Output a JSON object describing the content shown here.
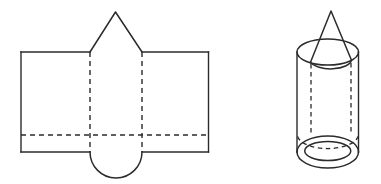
{
  "figure": {
    "title": "Net and solid of a cone-topped cylinder",
    "background_color": "#ffffff",
    "stroke_color": "#2b2b2b",
    "line_styles": {
      "solid_label": "solid edge (cut line)",
      "dashed_label": "dashed edge (fold or hidden line)"
    },
    "panels": [
      {
        "id": "net",
        "label": "Unfolded net",
        "description": "Rectangle with a triangular flap on top and a semicircular flap on the bottom, with vertical fold lines and one horizontal fold line.",
        "parts": [
          {
            "name": "outer-rectangle",
            "label": "Lateral surface rectangle",
            "style": "solid"
          },
          {
            "name": "triangle-flap",
            "label": "Triangular cone flap",
            "style": "solid"
          },
          {
            "name": "semicircle-flap",
            "label": "Semicircular base flap",
            "style": "solid"
          },
          {
            "name": "left-fold-line",
            "label": "Left vertical fold line",
            "style": "dashed"
          },
          {
            "name": "right-fold-line",
            "label": "Right vertical fold line",
            "style": "dashed"
          },
          {
            "name": "horizontal-fold-line",
            "label": "Horizontal fold line",
            "style": "dashed"
          }
        ]
      },
      {
        "id": "solid",
        "label": "Assembled solid",
        "description": "A cylinder capped by a cone, drawn in perspective with hidden edges dashed.",
        "parts": [
          {
            "name": "cone",
            "label": "Cone on top",
            "style": "solid"
          },
          {
            "name": "cylinder-body",
            "label": "Cylinder body",
            "style": "solid"
          },
          {
            "name": "top-ellipse",
            "label": "Top rim ellipse",
            "style": "solid"
          },
          {
            "name": "bottom-ellipse-outer",
            "label": "Bottom outer rim ellipse",
            "style": "solid"
          },
          {
            "name": "bottom-ellipse-inner",
            "label": "Bottom inner rim ellipse",
            "style": "solid"
          },
          {
            "name": "hidden-left-edge",
            "label": "Hidden left cone edge",
            "style": "dashed"
          },
          {
            "name": "hidden-right-edge",
            "label": "Hidden right cone edge",
            "style": "dashed"
          },
          {
            "name": "hidden-bottom-arc",
            "label": "Hidden bottom arc",
            "style": "dashed"
          }
        ]
      }
    ],
    "geometry": {
      "net": {
        "rect_left": 21,
        "rect_right": 208.5,
        "rect_top": 52,
        "rect_bottom": 152,
        "fold_left_x": 90,
        "fold_right_x": 142,
        "fold_horizontal_y": 135,
        "triangle_apex_x": 115.5,
        "triangle_apex_y": 12,
        "semicircle_bottom_y": 178.5
      },
      "solid": {
        "cyl_left_x": 297,
        "cyl_right_x": 358.5,
        "cyl_top_y": 52,
        "cyl_bottom_y": 152,
        "ellipse_ry": 13,
        "cone_apex_x": 331,
        "cone_apex_y": 11,
        "bottom_outer_ry": 16,
        "bottom_inner_rx": 23,
        "bottom_inner_ry": 9.5
      }
    }
  }
}
